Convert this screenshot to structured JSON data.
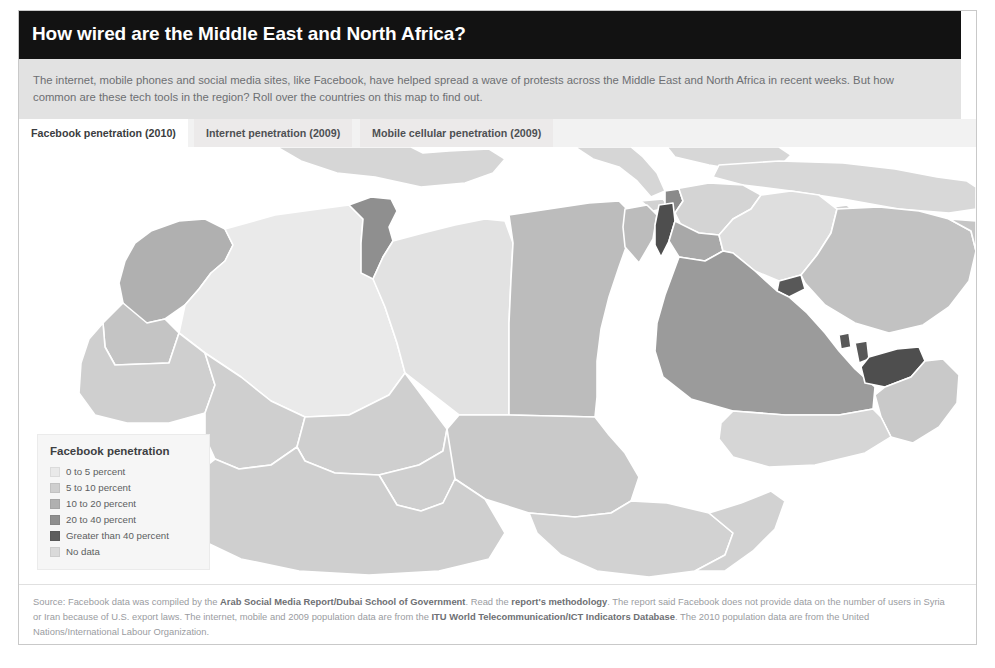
{
  "header": {
    "title": "How wired are the Middle East and North Africa?"
  },
  "deck": {
    "text": "The internet, mobile phones and social media sites, like Facebook, have helped spread a wave of protests across the Middle East and North Africa in recent weeks. But how common are these tech tools in the region? Roll over the countries on this map to find out."
  },
  "tabs": [
    {
      "label": "Facebook penetration (2010)",
      "active": true
    },
    {
      "label": "Internet penetration (2009)",
      "active": false
    },
    {
      "label": "Mobile cellular penetration (2009)",
      "active": false
    }
  ],
  "legend": {
    "title": "Facebook penetration",
    "items": [
      {
        "label": "0 to 5 percent",
        "color": "#e9e9e9"
      },
      {
        "label": "5 to 10 percent",
        "color": "#cfcfcf"
      },
      {
        "label": "10 to 20 percent",
        "color": "#b0b0b0"
      },
      {
        "label": "20 to 40 percent",
        "color": "#8f8f8f"
      },
      {
        "label": "Greater than 40 percent",
        "color": "#5e5e5e"
      },
      {
        "label": "No data",
        "color": "#dadada"
      }
    ]
  },
  "footer": {
    "source_prefix": "Source: Facebook data was compiled by the ",
    "source_link_1": "Arab Social Media Report/Dubai School of Government",
    "mid_1": ". Read the ",
    "source_link_2": "report's methodology",
    "mid_2": ". The report said Facebook does not provide data on the number of users in Syria or Iran because of U.S. export laws. The internet, mobile and 2009 population data are from the ",
    "source_link_3": "ITU World Telecommunication/ICT Indicators Database",
    "mid_3": ". The 2010 population data are from the United Nations/International Labour Organization."
  },
  "map": {
    "sea_color": "#ffffff",
    "border_color": "#ffffff",
    "regions": [
      {
        "name": "morocco",
        "bucket": "10 to 20 percent",
        "color": "#b0b0b0"
      },
      {
        "name": "western-sahara",
        "bucket": "No data",
        "color": "#c4c4c4"
      },
      {
        "name": "algeria",
        "bucket": "0 to 5 percent",
        "color": "#eaeaea"
      },
      {
        "name": "tunisia",
        "bucket": "20 to 40 percent",
        "color": "#8f8f8f"
      },
      {
        "name": "libya",
        "bucket": "0 to 5 percent",
        "color": "#e2e2e2"
      },
      {
        "name": "egypt",
        "bucket": "5 to 10 percent",
        "color": "#bcbcbc"
      },
      {
        "name": "sudan",
        "bucket": "0 to 5 percent",
        "color": "#c9c9c9"
      },
      {
        "name": "mauritania",
        "bucket": "No data",
        "color": "#cfcfcf"
      },
      {
        "name": "mali",
        "bucket": "No data",
        "color": "#cfcfcf"
      },
      {
        "name": "niger",
        "bucket": "No data",
        "color": "#cfcfcf"
      },
      {
        "name": "chad",
        "bucket": "No data",
        "color": "#cfcfcf"
      },
      {
        "name": "nigeria",
        "bucket": "No data",
        "color": "#cfcfcf"
      },
      {
        "name": "ethiopia",
        "bucket": "No data",
        "color": "#d2d2d2"
      },
      {
        "name": "somalia",
        "bucket": "No data",
        "color": "#d2d2d2"
      },
      {
        "name": "israel",
        "bucket": "Greater than 40 percent",
        "color": "#4e4e4e"
      },
      {
        "name": "lebanon",
        "bucket": "20 to 40 percent",
        "color": "#8a8a8a"
      },
      {
        "name": "jordan",
        "bucket": "10 to 20 percent",
        "color": "#a8a8a8"
      },
      {
        "name": "syria",
        "bucket": "No data",
        "color": "#d4d4d4"
      },
      {
        "name": "iraq",
        "bucket": "0 to 5 percent",
        "color": "#dedede"
      },
      {
        "name": "saudi-arabia",
        "bucket": "10 to 20 percent",
        "color": "#9b9b9b"
      },
      {
        "name": "kuwait",
        "bucket": "Greater than 40 percent",
        "color": "#585858"
      },
      {
        "name": "qatar",
        "bucket": "Greater than 40 percent",
        "color": "#585858"
      },
      {
        "name": "bahrain",
        "bucket": "Greater than 40 percent",
        "color": "#585858"
      },
      {
        "name": "uae",
        "bucket": "Greater than 40 percent",
        "color": "#4e4e4e"
      },
      {
        "name": "oman",
        "bucket": "0 to 5 percent",
        "color": "#c9c9c9"
      },
      {
        "name": "yemen",
        "bucket": "0 to 5 percent",
        "color": "#d6d6d6"
      },
      {
        "name": "iran",
        "bucket": "No data",
        "color": "#c2c2c2"
      },
      {
        "name": "turkey",
        "bucket": "No data",
        "color": "#d8d8d8"
      },
      {
        "name": "afghanistan",
        "bucket": "No data",
        "color": "#c6c6c6"
      },
      {
        "name": "pakistan",
        "bucket": "No data",
        "color": "#c6c6c6"
      },
      {
        "name": "europe-spain",
        "bucket": "No data",
        "color": "#d6d6d6"
      },
      {
        "name": "europe-italy",
        "bucket": "No data",
        "color": "#d6d6d6"
      }
    ]
  }
}
